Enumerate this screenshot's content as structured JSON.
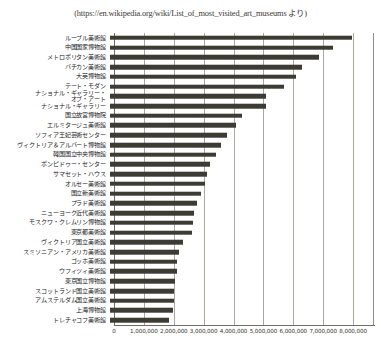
{
  "caption": "(https://en.wikipedia.org/wiki/List_of_most_visited_art_museums より)",
  "colors": {
    "bar": "#3c3c35",
    "grid": "#a9a9a0",
    "axis": "#6e6e66",
    "text": "#23231f",
    "background": "#ffffff"
  },
  "chart_data": {
    "type": "bar",
    "orientation": "horizontal",
    "title": "",
    "subtitle": "",
    "xlabel": "",
    "ylabel": "",
    "xlim": [
      0,
      8700000
    ],
    "grid": true,
    "legend": null,
    "xticks": [
      0,
      1000000,
      2000000,
      3000000,
      4000000,
      5000000,
      6000000,
      7000000,
      8000000
    ],
    "xtick_labels": [
      "0",
      "1,000,000",
      "2,000,000",
      "3,000,000",
      "4,000,000",
      "5,000,000",
      "6,000,000",
      "7,000,000",
      "8,000,000"
    ],
    "categories": [
      "ルーブル美術館",
      "中国国家博物館",
      "メトロポリタン美術館",
      "バチカン美術館",
      "大英博物館",
      "テート・モダン",
      "ナショナル・ギャラリー・\nオブ・アート",
      "ナショナル・ギャラリー",
      "国立故宮博物院",
      "エルミタージュ美術館",
      "ソフィア王妃芸術センター",
      "ヴィクトリア＆アルバート博物館",
      "韓国国立中央博物館",
      "ポンピドゥー・センター",
      "サマセット・ハウス",
      "オルセー美術館",
      "国立新美術館",
      "プラド美術館",
      "ニューヨーク近代美術館",
      "モスクワ・クレムリン博物館",
      "東京都美術館",
      "ヴィクトリア国立美術館",
      "スミソニアン・アメリカ美術館",
      "ゴッホ美術館",
      "ウフィツィ美術館",
      "東京国立博物館",
      "スコットランド国立美術館",
      "アムステルダム国立美術館",
      "上海博物館",
      "トレチャコフ美術館"
    ],
    "values": [
      8100000,
      7450000,
      7000000,
      6430000,
      6240000,
      5830000,
      5230000,
      5230000,
      4430000,
      4220000,
      3900000,
      3720000,
      3550000,
      3330000,
      3230000,
      3180000,
      3030000,
      2900000,
      2800000,
      2780000,
      2730000,
      2450000,
      2310000,
      2250000,
      2230000,
      2180000,
      2140000,
      2130000,
      2100000,
      1980000
    ]
  }
}
